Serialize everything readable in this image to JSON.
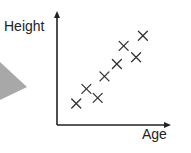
{
  "chart_data": {
    "type": "scatter",
    "title": "",
    "xlabel": "Age",
    "ylabel": "Height",
    "xlim": [
      0,
      10
    ],
    "ylim": [
      0,
      10
    ],
    "grid": false,
    "legend": null,
    "marker": "x",
    "series": [
      {
        "name": "Height vs Age",
        "points": [
          {
            "x": 1.7,
            "y": 1.9
          },
          {
            "x": 2.6,
            "y": 3.2
          },
          {
            "x": 3.6,
            "y": 2.4
          },
          {
            "x": 4.2,
            "y": 4.3
          },
          {
            "x": 5.3,
            "y": 5.4
          },
          {
            "x": 5.9,
            "y": 7.0
          },
          {
            "x": 7.0,
            "y": 6.0
          },
          {
            "x": 7.6,
            "y": 7.9
          }
        ]
      }
    ],
    "colors": {
      "marker": "#333333",
      "axis": "#222222",
      "pointer_arrow": "#a8a8a8"
    }
  }
}
